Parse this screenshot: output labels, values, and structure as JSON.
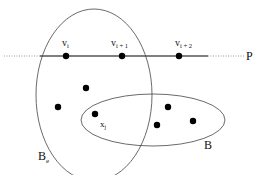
{
  "diagram": {
    "path_label": "P",
    "ellipse_big_label": "B",
    "ellipse_big_sub": "e",
    "ellipse_small_label": "B",
    "path_vertices": [
      {
        "base": "v",
        "sub": "i"
      },
      {
        "base": "v",
        "sub": "i + 1"
      },
      {
        "base": "v",
        "sub": "i + 2"
      }
    ],
    "point_label": {
      "base": "x",
      "sub": "j"
    },
    "colors": {
      "line": "#555555",
      "dots": "#000000",
      "ellipse": "#444444",
      "dotted": "#999999"
    }
  }
}
